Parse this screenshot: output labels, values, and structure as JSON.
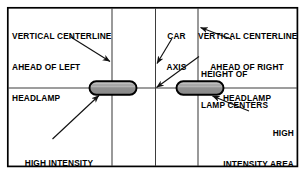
{
  "diagram": {
    "frame": {
      "x": 7,
      "y": 7,
      "width": 291,
      "height": 160
    },
    "colors": {
      "line": "#1a1a1a",
      "frame": "#000000",
      "grid": "#4a4a4a",
      "lamp_fill_top": "#b9b9b9",
      "lamp_fill_bottom": "#8d8d8d",
      "lamp_stroke": "#000000",
      "background": "#ffffff"
    },
    "grid": {
      "horizontal_centerline_y": 88,
      "vertical_lines_x": [
        112,
        155,
        198
      ],
      "labels": {
        "horizontal": "height-of-lamp-centers-line",
        "vertical_left": "vertical-centerline-left-headlamp",
        "vertical_mid": "car-axis-line",
        "vertical_right": "vertical-centerline-right-headlamp"
      }
    },
    "lamps": [
      {
        "name": "left-headlamp",
        "x": 89,
        "y": 81,
        "width": 48,
        "height": 14,
        "label": "left-headlamp-high-intensity-area"
      },
      {
        "name": "right-headlamp",
        "x": 176,
        "y": 81,
        "width": 48,
        "height": 14,
        "label": "right-headlamp-high-intensity-area"
      }
    ],
    "labels": {
      "vertical_centerline_left": {
        "lines": [
          "VERTICAL CENTERLINE",
          "AHEAD OF LEFT",
          "HEADLAMP"
        ],
        "align": "left"
      },
      "car_axis": {
        "lines": [
          "CAR",
          "AXIS"
        ],
        "align": "center"
      },
      "vertical_centerline_right": {
        "lines": [
          "VERTICAL CENTERLINE",
          "AHEAD OF RIGHT",
          "HEADLAMP"
        ],
        "align": "center"
      },
      "height_of_lamp_centers": {
        "lines": [
          "HEIGHT OF",
          "LAMP CENTERS"
        ],
        "align": "left"
      },
      "high_intensity_area_left": {
        "lines": [
          "HIGH INTENSITY",
          "AREA"
        ],
        "align": "center"
      },
      "high_intensity_area_right": {
        "lines": [
          "HIGH",
          "INTENSITY AREA"
        ],
        "align": "right"
      }
    },
    "arrows": [
      {
        "name": "arrow-to-left-vertical-centerline",
        "from": [
          71,
          37
        ],
        "to": [
          111,
          62
        ]
      },
      {
        "name": "arrow-to-car-axis",
        "from": [
          171,
          39
        ],
        "to": [
          156,
          64
        ]
      },
      {
        "name": "arrow-to-right-vertical-centerline",
        "from": [
          231,
          39
        ],
        "to": [
          200,
          27
        ]
      },
      {
        "name": "arrow-to-height-of-lamp-centers",
        "from": [
          198,
          57
        ],
        "to": [
          155,
          88
        ]
      },
      {
        "name": "arrow-to-left-high-intensity-area",
        "from": [
          53,
          139
        ],
        "to": [
          99,
          96
        ]
      },
      {
        "name": "arrow-to-right-high-intensity-area",
        "from": [
          248,
          111
        ],
        "to": [
          212,
          96
        ]
      }
    ]
  }
}
